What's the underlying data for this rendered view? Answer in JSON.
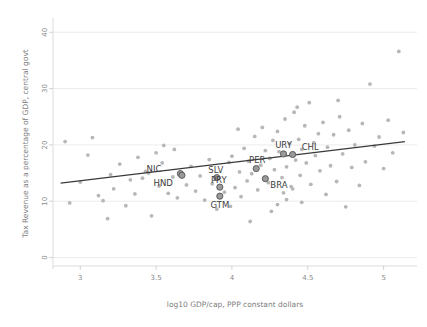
{
  "chart_data": {
    "type": "scatter",
    "title": "",
    "xlabel": "log10 GDP/cap, PPP constant dollars",
    "ylabel": "Tax Revenue as a percentage of GDP, central govt",
    "xlim": [
      2.82,
      5.22
    ],
    "ylim": [
      -1.5,
      42
    ],
    "xticks": [
      "3",
      "3.5",
      "4",
      "4.5",
      "5"
    ],
    "xtick_values": [
      3,
      3.5,
      4,
      4.5,
      5
    ],
    "yticks": [
      "0",
      "10",
      "20",
      "30",
      "40"
    ],
    "ytick_values": [
      0,
      10,
      20,
      30,
      40
    ],
    "grid": "horizontal",
    "legend": "none",
    "trendline": {
      "type": "linear-fit",
      "x_start": 2.87,
      "y_start": 13.2,
      "x_end": 5.14,
      "y_end": 20.6
    },
    "highlighted_points": [
      {
        "label": "NIC",
        "x": 3.66,
        "y": 14.9,
        "label_dx": -19,
        "label_dy": -2
      },
      {
        "label": "HND",
        "x": 3.67,
        "y": 14.6,
        "label_dx": -9,
        "label_dy": 11
      },
      {
        "label": "SLV",
        "x": 3.9,
        "y": 14.2,
        "label_dx": -1,
        "label_dy": -5
      },
      {
        "label": "PRY",
        "x": 3.92,
        "y": 12.5,
        "label_dx": -1,
        "label_dy": -4
      },
      {
        "label": "GTM",
        "x": 3.92,
        "y": 10.9,
        "label_dx": 0,
        "label_dy": 12
      },
      {
        "label": "PER",
        "x": 4.16,
        "y": 15.8,
        "label_dx": 1,
        "label_dy": -6
      },
      {
        "label": "BRA",
        "x": 4.22,
        "y": 14.0,
        "label_dx": 5,
        "label_dy": 9
      },
      {
        "label": "URY",
        "x": 4.34,
        "y": 18.4,
        "label_dx": 0,
        "label_dy": -6
      },
      {
        "label": "CHL",
        "x": 4.4,
        "y": 18.3,
        "label_dx": 9,
        "label_dy": -4
      }
    ],
    "points": [
      {
        "x": 2.9,
        "y": 20.6
      },
      {
        "x": 2.93,
        "y": 9.7
      },
      {
        "x": 3.0,
        "y": 13.4
      },
      {
        "x": 3.05,
        "y": 18.2
      },
      {
        "x": 3.08,
        "y": 21.3
      },
      {
        "x": 3.12,
        "y": 11.0
      },
      {
        "x": 3.15,
        "y": 10.1
      },
      {
        "x": 3.2,
        "y": 14.7
      },
      {
        "x": 3.22,
        "y": 12.2
      },
      {
        "x": 3.26,
        "y": 16.6
      },
      {
        "x": 3.3,
        "y": 9.2
      },
      {
        "x": 3.33,
        "y": 13.8
      },
      {
        "x": 3.36,
        "y": 11.3
      },
      {
        "x": 3.38,
        "y": 17.8
      },
      {
        "x": 3.41,
        "y": 14.1
      },
      {
        "x": 3.43,
        "y": 15.3
      },
      {
        "x": 3.45,
        "y": 15.0
      },
      {
        "x": 3.47,
        "y": 7.4
      },
      {
        "x": 3.5,
        "y": 18.6
      },
      {
        "x": 3.52,
        "y": 12.7
      },
      {
        "x": 3.55,
        "y": 19.9
      },
      {
        "x": 3.58,
        "y": 11.4
      },
      {
        "x": 3.61,
        "y": 14.3
      },
      {
        "x": 3.64,
        "y": 10.6
      },
      {
        "x": 3.7,
        "y": 12.9
      },
      {
        "x": 3.73,
        "y": 16.2
      },
      {
        "x": 3.76,
        "y": 11.8
      },
      {
        "x": 3.79,
        "y": 14.5
      },
      {
        "x": 3.82,
        "y": 10.2
      },
      {
        "x": 3.85,
        "y": 17.4
      },
      {
        "x": 3.87,
        "y": 13.1
      },
      {
        "x": 3.95,
        "y": 11.6
      },
      {
        "x": 3.98,
        "y": 16.9
      },
      {
        "x": 4.0,
        "y": 18.0
      },
      {
        "x": 4.02,
        "y": 12.4
      },
      {
        "x": 4.05,
        "y": 15.2
      },
      {
        "x": 4.06,
        "y": 10.8
      },
      {
        "x": 4.08,
        "y": 19.4
      },
      {
        "x": 4.1,
        "y": 13.6
      },
      {
        "x": 4.11,
        "y": 17.1
      },
      {
        "x": 4.13,
        "y": 14.9
      },
      {
        "x": 4.15,
        "y": 21.5
      },
      {
        "x": 4.17,
        "y": 12.0
      },
      {
        "x": 4.19,
        "y": 16.4
      },
      {
        "x": 4.2,
        "y": 23.1
      },
      {
        "x": 4.22,
        "y": 19.0
      },
      {
        "x": 4.24,
        "y": 13.3
      },
      {
        "x": 4.25,
        "y": 17.6
      },
      {
        "x": 4.27,
        "y": 20.8
      },
      {
        "x": 4.28,
        "y": 15.6
      },
      {
        "x": 4.3,
        "y": 22.4
      },
      {
        "x": 4.31,
        "y": 18.8
      },
      {
        "x": 4.33,
        "y": 14.2
      },
      {
        "x": 4.35,
        "y": 24.6
      },
      {
        "x": 4.36,
        "y": 16.1
      },
      {
        "x": 4.38,
        "y": 20.2
      },
      {
        "x": 4.39,
        "y": 12.6
      },
      {
        "x": 4.41,
        "y": 25.8
      },
      {
        "x": 4.42,
        "y": 17.3
      },
      {
        "x": 4.44,
        "y": 21.0
      },
      {
        "x": 4.45,
        "y": 14.6
      },
      {
        "x": 4.46,
        "y": 19.2
      },
      {
        "x": 4.48,
        "y": 23.4
      },
      {
        "x": 4.49,
        "y": 16.8
      },
      {
        "x": 4.51,
        "y": 27.5
      },
      {
        "x": 4.52,
        "y": 13.0
      },
      {
        "x": 4.54,
        "y": 20.4
      },
      {
        "x": 4.55,
        "y": 18.1
      },
      {
        "x": 4.57,
        "y": 22.0
      },
      {
        "x": 4.58,
        "y": 15.4
      },
      {
        "x": 4.6,
        "y": 24.0
      },
      {
        "x": 4.62,
        "y": 11.2
      },
      {
        "x": 4.63,
        "y": 19.6
      },
      {
        "x": 4.65,
        "y": 16.3
      },
      {
        "x": 4.67,
        "y": 21.8
      },
      {
        "x": 4.69,
        "y": 13.5
      },
      {
        "x": 4.71,
        "y": 25.0
      },
      {
        "x": 4.73,
        "y": 18.4
      },
      {
        "x": 4.75,
        "y": 9.0
      },
      {
        "x": 4.77,
        "y": 22.6
      },
      {
        "x": 4.79,
        "y": 16.0
      },
      {
        "x": 4.81,
        "y": 20.0
      },
      {
        "x": 4.84,
        "y": 12.8
      },
      {
        "x": 4.86,
        "y": 23.8
      },
      {
        "x": 4.88,
        "y": 17.0
      },
      {
        "x": 4.91,
        "y": 30.8
      },
      {
        "x": 4.94,
        "y": 19.8
      },
      {
        "x": 4.97,
        "y": 21.4
      },
      {
        "x": 5.0,
        "y": 15.8
      },
      {
        "x": 5.03,
        "y": 24.4
      },
      {
        "x": 5.06,
        "y": 18.6
      },
      {
        "x": 5.1,
        "y": 36.6
      },
      {
        "x": 5.13,
        "y": 22.2
      },
      {
        "x": 3.18,
        "y": 6.9
      },
      {
        "x": 3.9,
        "y": 8.6
      },
      {
        "x": 4.26,
        "y": 8.2
      },
      {
        "x": 4.46,
        "y": 9.8
      },
      {
        "x": 4.12,
        "y": 6.4
      },
      {
        "x": 3.62,
        "y": 19.2
      },
      {
        "x": 4.04,
        "y": 22.8
      },
      {
        "x": 4.43,
        "y": 26.7
      },
      {
        "x": 4.7,
        "y": 27.9
      },
      {
        "x": 4.34,
        "y": 11.5
      },
      {
        "x": 4.36,
        "y": 10.3
      },
      {
        "x": 4.4,
        "y": 12.2
      },
      {
        "x": 4.3,
        "y": 9.4
      },
      {
        "x": 3.99,
        "y": 9.1
      },
      {
        "x": 3.54,
        "y": 16.8
      }
    ]
  }
}
